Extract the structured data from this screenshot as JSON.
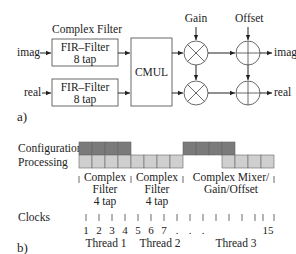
{
  "part_a": {
    "label": "a)",
    "group_label": "Complex Filter",
    "inputs": {
      "imag": "imag",
      "real": "real"
    },
    "fir_top": {
      "line1": "FIR–Filter",
      "line2": "8 tap"
    },
    "fir_bottom": {
      "line1": "FIR–Filter",
      "line2": "8 tap"
    },
    "cmul": "CMUL",
    "gain_label": "Gain",
    "offset_label": "Offset",
    "outputs": {
      "imag": "imag",
      "real": "real"
    },
    "multiplier_symbol": "times-circle",
    "adder_symbol": "plus-circle"
  },
  "part_b": {
    "label": "b)",
    "rows": {
      "configuration": "Configuration",
      "processing": "Processing"
    },
    "colors": {
      "configuration": "#7a7a7a",
      "processing": "#cfcfcf",
      "border": "#666666"
    },
    "configuration_cells": [
      0,
      1,
      2,
      3,
      8,
      9,
      10,
      11
    ],
    "processing_cells": [
      0,
      1,
      2,
      3,
      4,
      5,
      6,
      7,
      11,
      12,
      13,
      14
    ],
    "phases": [
      {
        "line1": "Complex",
        "line2": "Filter",
        "line3": "4 tap"
      },
      {
        "line1": "Complex",
        "line2": "Filter",
        "line3": "4 tap"
      },
      {
        "line1": "Complex Mixer/",
        "line2": "Gain/Offset",
        "line3": ""
      }
    ],
    "clocks_label": "Clocks",
    "clock_numbers": [
      "1",
      "2",
      "3",
      "4",
      "5",
      "6",
      "7",
      ".",
      ".",
      ".",
      "15"
    ],
    "threads": [
      "Thread 1",
      "Thread 2",
      "Thread 3"
    ]
  }
}
